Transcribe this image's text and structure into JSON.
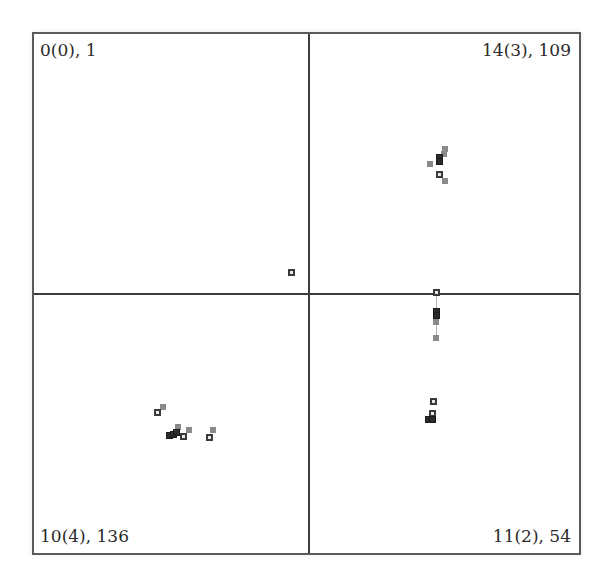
{
  "quadrants": [
    {
      "position": "top-left",
      "label": "0(0), 1"
    },
    {
      "position": "top-right",
      "label": "14(3), 109"
    },
    {
      "position": "bottom-left",
      "label": "10(4), 136"
    },
    {
      "position": "bottom-right",
      "label": "11(2), 54"
    }
  ],
  "colors": {
    "frame": "#5a5a5a",
    "divider": "#3c3c3c",
    "point_dark": "#2b2b2b",
    "point_gray": "#8a8a8a",
    "point_hollow_border": "#3a3a3a"
  },
  "points": [
    {
      "x": 291,
      "y": 272,
      "style": "hollow"
    },
    {
      "x": 445,
      "y": 149,
      "style": "gray"
    },
    {
      "x": 444,
      "y": 154,
      "style": "gray"
    },
    {
      "x": 439,
      "y": 157,
      "style": "dark"
    },
    {
      "x": 439,
      "y": 161,
      "style": "dark"
    },
    {
      "x": 430,
      "y": 164,
      "style": "gray"
    },
    {
      "x": 439,
      "y": 174,
      "style": "hollow"
    },
    {
      "x": 445,
      "y": 181,
      "style": "gray"
    },
    {
      "x": 436,
      "y": 292,
      "style": "hollow"
    },
    {
      "x": 436,
      "y": 311,
      "style": "dark"
    },
    {
      "x": 436,
      "y": 315,
      "style": "dark"
    },
    {
      "x": 436,
      "y": 322,
      "style": "gray"
    },
    {
      "x": 436,
      "y": 338,
      "style": "gray"
    },
    {
      "x": 433,
      "y": 401,
      "style": "hollow"
    },
    {
      "x": 432,
      "y": 413,
      "style": "hollow"
    },
    {
      "x": 428,
      "y": 419,
      "style": "dark"
    },
    {
      "x": 432,
      "y": 419,
      "style": "dark"
    },
    {
      "x": 163,
      "y": 407,
      "style": "gray"
    },
    {
      "x": 157,
      "y": 412,
      "style": "hollow"
    },
    {
      "x": 178,
      "y": 427,
      "style": "gray"
    },
    {
      "x": 189,
      "y": 430,
      "style": "gray"
    },
    {
      "x": 169,
      "y": 435,
      "style": "dark"
    },
    {
      "x": 173,
      "y": 434,
      "style": "dark"
    },
    {
      "x": 176,
      "y": 432,
      "style": "dark"
    },
    {
      "x": 183,
      "y": 436,
      "style": "hollow"
    },
    {
      "x": 213,
      "y": 430,
      "style": "gray"
    },
    {
      "x": 209,
      "y": 437,
      "style": "hollow"
    }
  ],
  "links": [
    {
      "x": 436,
      "y1": 295,
      "y2": 338
    }
  ]
}
